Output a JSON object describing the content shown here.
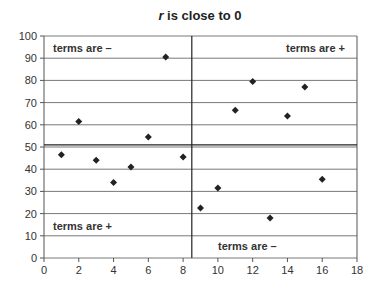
{
  "chart_data": {
    "type": "scatter",
    "title": "r is close to 0",
    "title_italic_prefix": "r",
    "title_rest": " is close to 0",
    "xlabel": "",
    "ylabel": "",
    "xlim": [
      0,
      18
    ],
    "ylim": [
      0,
      100
    ],
    "xticks": [
      0,
      2,
      4,
      6,
      8,
      10,
      12,
      14,
      16,
      18
    ],
    "yticks": [
      0,
      10,
      20,
      30,
      40,
      50,
      60,
      70,
      80,
      90,
      100
    ],
    "grid": "horizontal",
    "points": [
      [
        1,
        46.5
      ],
      [
        2,
        61.5
      ],
      [
        3,
        44
      ],
      [
        4,
        34
      ],
      [
        5,
        41
      ],
      [
        6,
        54.5
      ],
      [
        7,
        90.5
      ],
      [
        8,
        45.5
      ],
      [
        9,
        22.5
      ],
      [
        10,
        31.5
      ],
      [
        11,
        66.5
      ],
      [
        12,
        79.5
      ],
      [
        13,
        18
      ],
      [
        14,
        64
      ],
      [
        15,
        77
      ],
      [
        16,
        35.5
      ]
    ],
    "mean_lines": {
      "x": 8.5,
      "y": 51
    },
    "annotations": [
      {
        "text": "terms are –",
        "quadrant": "top-left"
      },
      {
        "text": "terms are +",
        "quadrant": "top-right"
      },
      {
        "text": "terms are +",
        "quadrant": "bottom-left"
      },
      {
        "text": "terms are –",
        "quadrant": "bottom-right"
      }
    ]
  }
}
